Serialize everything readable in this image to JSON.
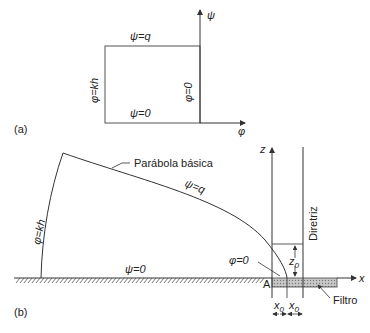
{
  "panel_a": {
    "tag": "(a)",
    "top_label": "ψ=q",
    "bottom_label": "ψ=0",
    "left_label": "φ=kh",
    "right_label": "φ=0",
    "y_axis": "ψ",
    "x_axis": "φ"
  },
  "panel_b": {
    "tag": "(b)",
    "parabola_label": "Parábola básica",
    "top_curve_label": "ψ=q",
    "left_curve_label": "φ=kh",
    "ground_label": "ψ=0",
    "phi_zero_label": "φ=0",
    "point_label": "A",
    "z_axis": "z",
    "x_axis": "x",
    "directrix_label": "Diretriz",
    "z0_label": "z",
    "z0_sub": "0",
    "x0_label_1": "x",
    "x0_sub_1": "0",
    "x0_label_2": "x",
    "x0_sub_2": "0",
    "filter_label": "Filtro"
  },
  "colors": {
    "line": "#333333",
    "filter_fill": "#bbbbbb"
  }
}
